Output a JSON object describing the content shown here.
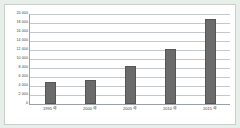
{
  "chart_data": {
    "type": "bar",
    "title": "",
    "xlabel": "",
    "ylabel": "",
    "categories": [
      "1995 年",
      "2000 年",
      "2005 年",
      "2010 年",
      "2015 年"
    ],
    "values": [
      4900,
      5300,
      8500,
      12300,
      18800
    ],
    "series": [
      {
        "name": "",
        "values": [
          4900,
          5300,
          8500,
          12300,
          18800
        ]
      }
    ],
    "ylim": [
      0,
      20000
    ],
    "ytick_values": [
      0,
      2000,
      4000,
      6000,
      8000,
      10000,
      12000,
      14000,
      16000,
      18000,
      20000
    ],
    "ytick_labels": [
      "0",
      "2 000",
      "4 000",
      "6 000",
      "8 000",
      "10 000",
      "12 000",
      "14 000",
      "16 000",
      "18 000",
      "20 000"
    ],
    "grid": true,
    "grid_axis": "y",
    "legend": false,
    "legend_position": "none",
    "bar_color": "#6b6b6b",
    "bar_edge_color": "#555555",
    "plot_background": "#ffffff",
    "figure_background": "#e8eeea",
    "axis_color": "#9aa0a4",
    "gridline_color": "#c2c8cc",
    "tick_text_color": "#3a3a3a"
  }
}
